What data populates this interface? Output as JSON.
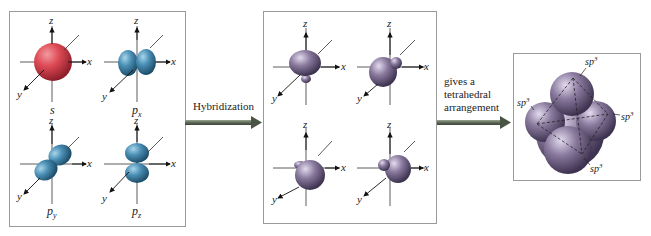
{
  "diagram": {
    "left_panel": {
      "orbitals": [
        {
          "name": "s",
          "sub": "",
          "color": "#d9434f"
        },
        {
          "name": "p",
          "sub": "x",
          "color": "#4a8fb5"
        },
        {
          "name": "p",
          "sub": "y",
          "color": "#4a8fb5"
        },
        {
          "name": "p",
          "sub": "z",
          "color": "#4a8fb5"
        }
      ],
      "axes": {
        "x": "x",
        "y": "y",
        "z": "z"
      }
    },
    "arrow1": {
      "label": "Hybridization"
    },
    "middle_panel": {
      "orbital_count": 4,
      "color": "#8a7a9e",
      "axes": {
        "x": "x",
        "y": "y",
        "z": "z"
      }
    },
    "arrow2": {
      "label_lines": [
        "gives a",
        "tetrahedral",
        "arrangement"
      ]
    },
    "right_panel": {
      "labels": [
        "sp3",
        "sp3",
        "sp3",
        "sp3"
      ],
      "label_base": "sp",
      "label_sup": "3",
      "color": "#8a7a9e"
    },
    "colors": {
      "s_orbital": "#d9434f",
      "p_orbital": "#4a8fb5",
      "hybrid_orbital": "#8a7a9e",
      "arrow": "#5f6b58",
      "border": "#9a9a9a"
    }
  }
}
